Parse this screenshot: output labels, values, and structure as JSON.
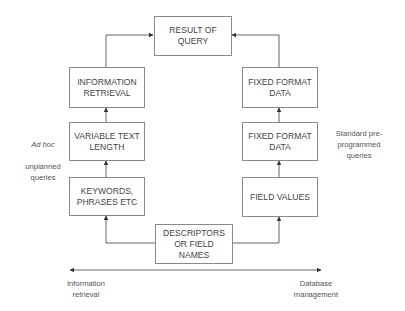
{
  "diagram": {
    "type": "flowchart",
    "nodes": {
      "result": "RESULT OF\nQUERY",
      "info_retrieval": "INFORMATION\nRETRIEVAL",
      "variable_text": "VARIABLE TEXT\nLENGTH",
      "keywords": "KEYWORDS,\nPHRASES ETC",
      "fixed_format_top": "FIXED FORMAT\nDATA",
      "fixed_format_mid": "FIXED FORMAT\nDATA",
      "field_values": "FIELD VALUES",
      "descriptors": "DESCRIPTORS\nOR FIELD\nNAMES"
    },
    "side_labels": {
      "left_italic": "Ad hoc",
      "left_rest": "unplanned\nqueries",
      "right": "Standard pre-\nprogrammed\nqueries"
    },
    "axis": {
      "left_label": "Information\nretrieval",
      "right_label": "Database\nmanagement"
    },
    "edges": [
      [
        "descriptors",
        "keywords"
      ],
      [
        "descriptors",
        "field_values"
      ],
      [
        "keywords",
        "variable_text"
      ],
      [
        "variable_text",
        "info_retrieval"
      ],
      [
        "info_retrieval",
        "result"
      ],
      [
        "field_values",
        "fixed_format_mid"
      ],
      [
        "fixed_format_mid",
        "fixed_format_top"
      ],
      [
        "fixed_format_top",
        "result"
      ]
    ],
    "colors": {
      "line": "#555555",
      "border": "#8a8a8a",
      "text": "#444444"
    }
  }
}
